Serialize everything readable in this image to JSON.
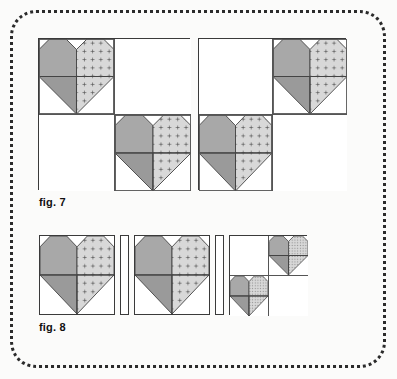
{
  "figure": {
    "title_fig7": "fig. 7",
    "title_fig8": "fig. 8"
  },
  "colors": {
    "background": "#fbfbfa",
    "frame_dots": "#2b2b2b",
    "block_outline": "#3a3a3a",
    "seam_line": "#555555",
    "fabric_dark": "#a8a8a8",
    "fabric_dark_shade": "#9a9a9a",
    "fabric_light": "#d8d8d8",
    "fabric_light_print": "#555555",
    "fabric_background": "#ffffff"
  },
  "fig7": {
    "label": "fig. 7",
    "blocks": [
      {
        "name": "block-left",
        "layout": "2x2",
        "quadrants": [
          {
            "position": "top-left",
            "content": "heart"
          },
          {
            "position": "top-right",
            "content": "plain"
          },
          {
            "position": "bottom-left",
            "content": "plain"
          },
          {
            "position": "bottom-right",
            "content": "heart"
          }
        ]
      },
      {
        "name": "block-right",
        "layout": "2x2",
        "quadrants": [
          {
            "position": "top-left",
            "content": "plain"
          },
          {
            "position": "top-right",
            "content": "heart"
          },
          {
            "position": "bottom-left",
            "content": "heart"
          },
          {
            "position": "bottom-right",
            "content": "plain"
          }
        ]
      }
    ]
  },
  "fig8": {
    "label": "fig. 8",
    "units": [
      {
        "name": "heart-block-1",
        "type": "heart-block"
      },
      {
        "name": "sashing-strip-1",
        "type": "sashing"
      },
      {
        "name": "heart-block-2",
        "type": "heart-block"
      },
      {
        "name": "sashing-strip-2",
        "type": "sashing"
      },
      {
        "name": "four-patch-block",
        "type": "2x2-block",
        "quadrants": [
          {
            "position": "top-left",
            "content": "plain"
          },
          {
            "position": "top-right",
            "content": "heart"
          },
          {
            "position": "bottom-left",
            "content": "heart"
          },
          {
            "position": "bottom-right",
            "content": "plain"
          }
        ]
      }
    ]
  },
  "heart_motif": {
    "name": "patchwork-heart",
    "left_half_fabric": "solid-dark-gray",
    "right_half_fabric": "light-gray-cross-print",
    "top_corners": "background triangles",
    "top_center": "background v-notch",
    "bottom": "downward point"
  }
}
